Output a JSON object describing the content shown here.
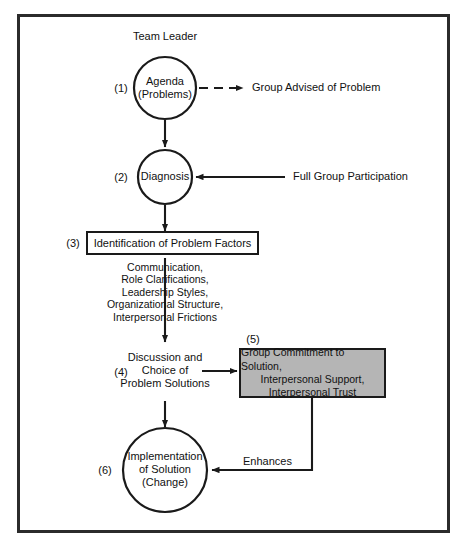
{
  "diagram": {
    "title_label": "Team Leader",
    "steps": [
      {
        "num": "(1)",
        "shape": "circle",
        "lines": [
          "Agenda",
          "(Problems)"
        ]
      },
      {
        "num": "(2)",
        "shape": "circle",
        "lines": [
          "Diagnosis"
        ]
      },
      {
        "num": "(3)",
        "shape": "box",
        "lines": [
          "Identification of Problem Factors"
        ]
      },
      {
        "num": "(4)",
        "shape": "text",
        "lines": [
          "Discussion and",
          "Choice of",
          "Problem Solutions"
        ]
      },
      {
        "num": "(5)",
        "shape": "gray-box",
        "lines": [
          "Group Commitment to Solution,",
          "Interpersonal Support,",
          "Interpersonal Trust"
        ]
      },
      {
        "num": "(6)",
        "shape": "circle",
        "lines": [
          "Implementation",
          "of Solution",
          "(Change)"
        ]
      }
    ],
    "annotations": {
      "group_advised": "Group Advised of Problem",
      "full_group": "Full Group Participation",
      "enhances": "Enhances"
    },
    "factor_list": [
      "Communication,",
      "Role Clarifications,",
      "Leadership Styles,",
      "Organizational Structure,",
      "Interpersonal Frictions"
    ],
    "colors": {
      "stroke": "#1a1a1a",
      "gray_fill": "#b5b5b5",
      "frame": "#2b2b2b",
      "background": "#ffffff"
    }
  }
}
